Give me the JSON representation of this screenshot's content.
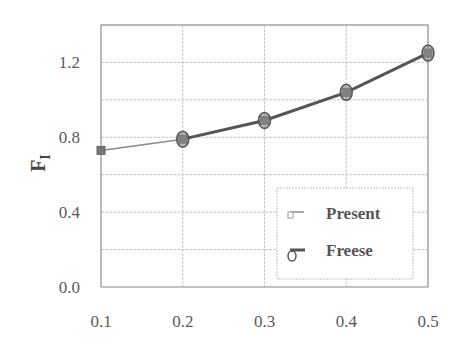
{
  "chart_data": {
    "type": "line",
    "title": "",
    "xlabel": "",
    "ylabel": "F",
    "ylabel_subscript": "I",
    "xlim": [
      0.1,
      0.5
    ],
    "ylim": [
      0.0,
      1.4
    ],
    "xticks": [
      0.1,
      0.2,
      0.3,
      0.4,
      0.5
    ],
    "xtick_labels": [
      "0.1",
      "0.2",
      "0.3",
      "0.4",
      "0.5"
    ],
    "yticks": [
      0.0,
      0.4,
      0.8,
      1.2
    ],
    "ytick_labels": [
      "0.0",
      "0.4",
      "0.8",
      "1.2"
    ],
    "y_gridlines": [
      0.2,
      0.4,
      0.6,
      0.8,
      1.0,
      1.2,
      1.4
    ],
    "grid": true,
    "legend_position": "lower right",
    "series": [
      {
        "name": "Present",
        "x": [
          0.1,
          0.2,
          0.3,
          0.4,
          0.5
        ],
        "values": [
          0.73,
          0.79,
          0.89,
          1.04,
          1.25
        ],
        "color": "#8a8a8a",
        "marker": "square",
        "line_width": 1.5
      },
      {
        "name": "Freese",
        "x": [
          0.2,
          0.3,
          0.4,
          0.5
        ],
        "values": [
          0.79,
          0.89,
          1.04,
          1.25
        ],
        "color": "#555555",
        "marker": "circle",
        "line_width": 3
      }
    ]
  },
  "legend": {
    "items": [
      {
        "label": "Present"
      },
      {
        "label": "Freese"
      }
    ]
  },
  "colors": {
    "grid": "#c8c8c8",
    "frame": "#9a9a9a",
    "present": "#8a8a8a",
    "freese": "#555555"
  }
}
